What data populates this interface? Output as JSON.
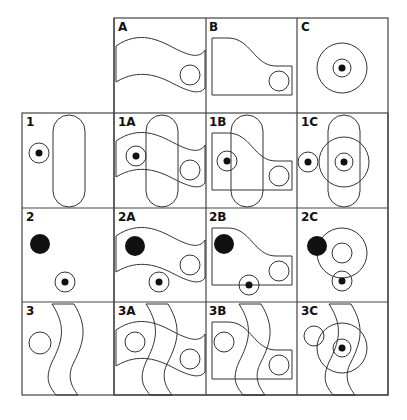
{
  "diagram": {
    "columns": [
      "A",
      "B",
      "C"
    ],
    "rows": [
      "1",
      "2",
      "3"
    ],
    "cells": {
      "A": {
        "label": "A"
      },
      "B": {
        "label": "B"
      },
      "C": {
        "label": "C"
      },
      "r1": {
        "label": "1"
      },
      "r1A": {
        "label": "1A"
      },
      "r1B": {
        "label": "1B"
      },
      "r1C": {
        "label": "1C"
      },
      "r2": {
        "label": "2"
      },
      "r2A": {
        "label": "2A"
      },
      "r2B": {
        "label": "2B"
      },
      "r2C": {
        "label": "2C"
      },
      "r3": {
        "label": "3"
      },
      "r3A": {
        "label": "3A"
      },
      "r3B": {
        "label": "3B"
      },
      "r3C": {
        "label": "3C"
      }
    },
    "colors": {
      "stroke": "#333333",
      "fill_dot": "#111111",
      "background": "#ffffff"
    }
  }
}
